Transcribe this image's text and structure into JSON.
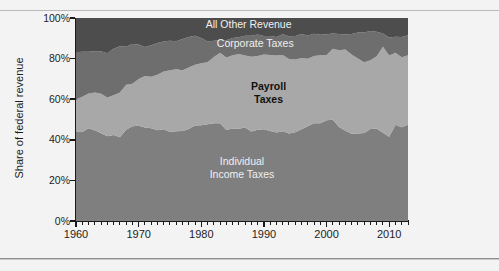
{
  "figure": {
    "background": "#f3f3f3",
    "rule_color": "#b9b9b9"
  },
  "chart_data": {
    "type": "area",
    "stacked": true,
    "title": "",
    "subtitle": "",
    "xlabel": "",
    "ylabel": "Share of federal revenue",
    "xlim": [
      1960,
      2013
    ],
    "ylim": [
      0,
      100
    ],
    "grid": false,
    "legend_position": "inline-annotations",
    "y_ticks": [
      0,
      20,
      40,
      60,
      80,
      100
    ],
    "y_tick_labels": [
      "0%",
      "20%",
      "40%",
      "60%",
      "80%",
      "100%"
    ],
    "x_ticks": [
      1960,
      1970,
      1980,
      1990,
      2000,
      2010
    ],
    "x_tick_labels": [
      "1960",
      "1970",
      "1980",
      "1990",
      "2000",
      "2010"
    ],
    "x_minor_tick_interval": 1,
    "colors": {
      "individual_income_taxes": "#7f7f7f",
      "payroll_taxes": "#a8a8a8",
      "corporate_taxes": "#6e6e6e",
      "all_other_revenue": "#4d4d4d"
    },
    "x": [
      1960,
      1961,
      1962,
      1963,
      1964,
      1965,
      1966,
      1967,
      1968,
      1969,
      1970,
      1971,
      1972,
      1973,
      1974,
      1975,
      1976,
      1977,
      1978,
      1979,
      1980,
      1981,
      1982,
      1983,
      1984,
      1985,
      1986,
      1987,
      1988,
      1989,
      1990,
      1991,
      1992,
      1993,
      1994,
      1995,
      1996,
      1997,
      1998,
      1999,
      2000,
      2001,
      2002,
      2003,
      2004,
      2005,
      2006,
      2007,
      2008,
      2009,
      2010,
      2011,
      2012,
      2013
    ],
    "series": [
      {
        "name": "Individual Income Taxes",
        "label": "Individual\nIncome Taxes",
        "label_lines": [
          "Individual",
          "Income Taxes"
        ],
        "color": "#7f7f7f",
        "label_color": "#f0f0f0",
        "values": [
          44.0,
          43.8,
          45.7,
          44.7,
          43.2,
          41.8,
          42.4,
          41.3,
          44.9,
          46.7,
          46.9,
          46.1,
          45.7,
          44.7,
          45.2,
          43.9,
          44.2,
          44.3,
          45.3,
          47.0,
          47.2,
          47.7,
          48.2,
          48.1,
          44.8,
          45.6,
          45.4,
          46.0,
          44.1,
          45.0,
          45.2,
          44.3,
          43.6,
          44.2,
          43.1,
          43.7,
          45.2,
          46.7,
          48.1,
          48.1,
          49.6,
          49.9,
          46.3,
          44.5,
          43.0,
          43.1,
          43.4,
          45.3,
          45.4,
          43.5,
          41.5,
          47.4,
          46.2,
          47.4
        ]
      },
      {
        "name": "Payroll Taxes",
        "label": "Payroll\nTaxes",
        "label_lines": [
          "Payroll",
          "Taxes"
        ],
        "color": "#a8a8a8",
        "label_color": "#111111",
        "values": [
          15.9,
          17.4,
          17.1,
          18.6,
          19.5,
          19.0,
          19.5,
          22.0,
          22.2,
          20.9,
          23.0,
          25.3,
          25.4,
          27.3,
          28.5,
          30.3,
          30.5,
          29.9,
          30.3,
          30.0,
          30.5,
          30.5,
          32.6,
          34.8,
          35.7,
          36.1,
          36.9,
          35.5,
          36.8,
          36.3,
          36.8,
          37.5,
          37.9,
          37.6,
          36.7,
          35.8,
          35.1,
          33.2,
          33.2,
          33.5,
          32.2,
          34.9,
          37.8,
          40.0,
          39.0,
          36.9,
          34.8,
          33.9,
          35.7,
          42.3,
          40.0,
          35.5,
          34.5,
          34.2
        ]
      },
      {
        "name": "Corporate Taxes",
        "label": "Corporate Taxes",
        "label_lines": [
          "Corporate Taxes"
        ],
        "color": "#6e6e6e",
        "label_color": "#f0f0f0",
        "values": [
          23.2,
          22.2,
          20.6,
          20.3,
          20.9,
          21.8,
          23.0,
          22.8,
          18.7,
          19.6,
          17.0,
          14.3,
          15.5,
          15.7,
          14.7,
          14.6,
          13.9,
          15.4,
          15.0,
          14.2,
          12.5,
          10.2,
          8.0,
          6.2,
          8.5,
          8.4,
          8.2,
          9.8,
          10.4,
          10.6,
          9.1,
          9.3,
          9.2,
          10.2,
          11.2,
          11.6,
          11.8,
          11.5,
          11.0,
          10.1,
          10.2,
          7.6,
          8.0,
          7.4,
          10.1,
          12.9,
          14.7,
          14.4,
          12.1,
          6.6,
          8.9,
          7.9,
          9.9,
          9.9
        ]
      },
      {
        "name": "All Other Revenue",
        "label": "All Other Revenue",
        "label_lines": [
          "All Other Revenue"
        ],
        "color": "#4d4d4d",
        "label_color": "#f0f0f0",
        "values": [
          16.9,
          16.6,
          16.6,
          16.4,
          16.4,
          17.4,
          15.1,
          13.9,
          14.2,
          12.8,
          13.1,
          14.3,
          13.4,
          12.3,
          11.6,
          11.2,
          11.4,
          10.4,
          9.4,
          8.8,
          9.8,
          11.6,
          11.2,
          10.9,
          11.0,
          9.9,
          9.5,
          8.7,
          8.7,
          8.1,
          8.9,
          8.9,
          9.3,
          8.0,
          9.0,
          8.9,
          7.9,
          8.6,
          7.7,
          8.3,
          8.0,
          7.6,
          7.9,
          8.1,
          7.9,
          7.1,
          7.1,
          6.4,
          6.8,
          7.6,
          9.6,
          9.2,
          9.4,
          8.5
        ]
      }
    ]
  },
  "axis_title": {
    "y": "Share of federal revenue"
  }
}
